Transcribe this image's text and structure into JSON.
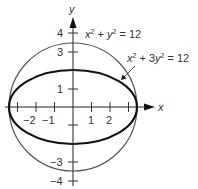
{
  "diagram": {
    "axes": {
      "x_label": "x",
      "y_label": "y",
      "x_tick_labels": [
        {
          "value": -2,
          "label": "−2"
        },
        {
          "value": -1,
          "label": "−1"
        },
        {
          "value": 1,
          "label": "1"
        },
        {
          "value": 2,
          "label": "2"
        }
      ],
      "y_tick_labels": [
        {
          "value": 4,
          "label": "4"
        },
        {
          "value": 3,
          "label": "3"
        },
        {
          "value": 1,
          "label": "1"
        },
        {
          "value": -3,
          "label": "−3"
        },
        {
          "value": -4,
          "label": "−4"
        }
      ]
    },
    "curves": [
      {
        "name": "circle",
        "equation_parts": {
          "a": "x",
          "a_exp": "2",
          "op": " + ",
          "b": "y",
          "b_exp": "2",
          "rhs": " = 12"
        },
        "equation": "x² + y² = 12",
        "stroke": "#555555"
      },
      {
        "name": "ellipse",
        "equation_parts": {
          "a": "x",
          "a_exp": "2",
          "op": " + 3",
          "b": "y",
          "b_exp": "2",
          "rhs": " = 12"
        },
        "equation": "x² + 3y² = 12",
        "stroke": "#111111"
      }
    ]
  }
}
